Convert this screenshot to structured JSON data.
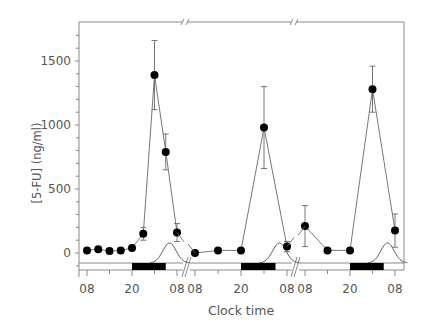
{
  "chart_data": {
    "type": "line",
    "title": "",
    "xlabel": "Clock time",
    "ylabel": "[5-FU] (ng/ml)",
    "ylim": [
      -150,
      1800
    ],
    "yticks": [
      0,
      500,
      1000,
      1500
    ],
    "grid": false,
    "legend": null,
    "segments": [
      {
        "xtick_labels": [
          "08",
          "20",
          "08"
        ],
        "points": [
          {
            "t": 8,
            "value": 20,
            "err": 20
          },
          {
            "t": 11,
            "value": 30,
            "err": 20
          },
          {
            "t": 14,
            "value": 15,
            "err": 20
          },
          {
            "t": 17,
            "value": 20,
            "err": 20
          },
          {
            "t": 20,
            "value": 40,
            "err": 20
          },
          {
            "t": 23,
            "value": 150,
            "err": 50
          },
          {
            "t": 26,
            "value": 1390,
            "err": 270
          },
          {
            "t": 29,
            "value": 790,
            "err": 140
          },
          {
            "t": 32,
            "value": 160,
            "err": 70
          }
        ],
        "dark_period": [
          20,
          29
        ],
        "rhythm_curve_peak": 30
      },
      {
        "xtick_labels": [
          "08",
          "20",
          "08"
        ],
        "points": [
          {
            "t": 8,
            "value": 0,
            "err": 0
          },
          {
            "t": 14,
            "value": 20,
            "err": 0
          },
          {
            "t": 20,
            "value": 20,
            "err": 0
          },
          {
            "t": 26,
            "value": 980,
            "err": 320
          },
          {
            "t": 32,
            "value": 50,
            "err": 40
          }
        ],
        "dark_period": [
          20,
          29
        ],
        "rhythm_curve_peak": 30
      },
      {
        "xtick_labels": [
          "08",
          "20",
          "08"
        ],
        "points": [
          {
            "t": 8,
            "value": 210,
            "err": 160
          },
          {
            "t": 14,
            "value": 20,
            "err": 0
          },
          {
            "t": 20,
            "value": 20,
            "err": 0
          },
          {
            "t": 26,
            "value": 1280,
            "err": 180
          },
          {
            "t": 32,
            "value": 175,
            "err": 130
          }
        ],
        "dark_period": [
          20,
          29
        ],
        "rhythm_curve_peak": 30
      }
    ],
    "annotations": [
      "axis break marks (//) between segments on top axis and x-axis",
      "black bars mark dark periods",
      "bell curves indicate circadian rhythm"
    ]
  },
  "axis": {
    "ylabel": "[5-FU] (ng/ml)",
    "xlabel": "Clock time",
    "ytick_labels": [
      "0",
      "500",
      "1000",
      "1500"
    ],
    "xtick_labels": [
      "08",
      "20",
      "08",
      "08",
      "20",
      "08",
      "08",
      "20",
      "08"
    ]
  },
  "colors": {
    "axis": "#888888",
    "line": "#666666",
    "marker": "#000000",
    "text": "#555555",
    "dark_bar": "#000000"
  }
}
